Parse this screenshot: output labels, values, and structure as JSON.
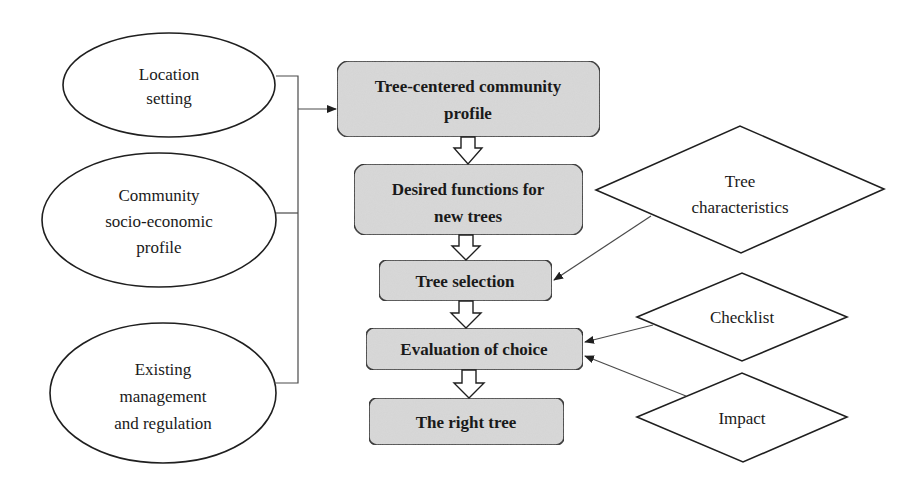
{
  "diagram": {
    "type": "flowchart",
    "colors": {
      "background": "#ffffff",
      "process_fill": "#d9d9d9",
      "stroke": "#1f1f1f",
      "connector": "#4a4a4a"
    },
    "inputs": [
      {
        "id": "location",
        "shape": "ellipse",
        "lines": [
          "Location",
          "setting"
        ]
      },
      {
        "id": "community",
        "shape": "ellipse",
        "lines": [
          "Community",
          "socio-economic",
          "profile"
        ]
      },
      {
        "id": "existing",
        "shape": "ellipse",
        "lines": [
          "Existing",
          "management",
          "and regulation"
        ]
      }
    ],
    "process": [
      {
        "id": "profile",
        "shape": "rounded-rect",
        "lines": [
          "Tree-centered community",
          "profile"
        ]
      },
      {
        "id": "functions",
        "shape": "rounded-rect",
        "lines": [
          "Desired functions for",
          "new trees"
        ]
      },
      {
        "id": "selection",
        "shape": "rounded-rect",
        "lines": [
          "Tree selection"
        ]
      },
      {
        "id": "evaluation",
        "shape": "rounded-rect",
        "lines": [
          "Evaluation of choice"
        ]
      },
      {
        "id": "result",
        "shape": "rounded-rect",
        "lines": [
          "The right tree"
        ]
      }
    ],
    "modifiers": [
      {
        "id": "characteristics",
        "shape": "diamond",
        "lines": [
          "Tree",
          "characteristics"
        ],
        "target": "selection"
      },
      {
        "id": "checklist",
        "shape": "diamond",
        "lines": [
          "Checklist"
        ],
        "target": "evaluation"
      },
      {
        "id": "impact",
        "shape": "diamond",
        "lines": [
          "Impact"
        ],
        "target": "evaluation"
      }
    ],
    "edges": [
      {
        "from": [
          "location",
          "community",
          "existing"
        ],
        "to": "profile",
        "style": "bracket-arrow"
      },
      {
        "from": "profile",
        "to": "functions",
        "style": "block-arrow"
      },
      {
        "from": "functions",
        "to": "selection",
        "style": "block-arrow"
      },
      {
        "from": "selection",
        "to": "evaluation",
        "style": "block-arrow"
      },
      {
        "from": "evaluation",
        "to": "result",
        "style": "block-arrow"
      },
      {
        "from": "characteristics",
        "to": "selection",
        "style": "line-arrow"
      },
      {
        "from": "checklist",
        "to": "evaluation",
        "style": "line-arrow"
      },
      {
        "from": "impact",
        "to": "evaluation",
        "style": "line-arrow"
      }
    ]
  }
}
